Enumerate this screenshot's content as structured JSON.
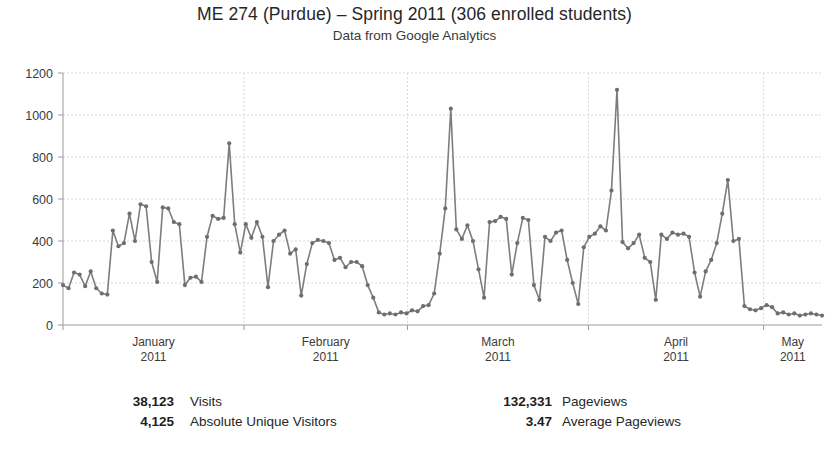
{
  "header": {
    "title": "ME 274 (Purdue) – Spring 2011 (306 enrolled students)",
    "subtitle": "Data from Google Analytics"
  },
  "axis": {
    "y_ticks": [
      "0",
      "200",
      "400",
      "600",
      "800",
      "1000",
      "1200"
    ],
    "x_labels": [
      {
        "month": "January",
        "year": "2011"
      },
      {
        "month": "February",
        "year": "2011"
      },
      {
        "month": "March",
        "year": "2011"
      },
      {
        "month": "April",
        "year": "2011"
      },
      {
        "month": "May",
        "year": "2011"
      }
    ]
  },
  "stats": {
    "left": [
      {
        "value": "38,123",
        "label": "Visits"
      },
      {
        "value": "4,125",
        "label": "Absolute Unique Visitors"
      }
    ],
    "right": [
      {
        "value": "132,331",
        "label": "Pageviews"
      },
      {
        "value": "3.47",
        "label": "Average Pageviews"
      }
    ]
  },
  "colors": {
    "line": "#7d7d7d",
    "marker": "#6e6e6e",
    "grid": "#d9d9d9",
    "axis": "#9a9a9a",
    "text": "#2b2b2b"
  },
  "chart_data": {
    "type": "line",
    "title": "ME 274 (Purdue) – Spring 2011 (306 enrolled students)",
    "subtitle": "Data from Google Analytics",
    "xlabel": "",
    "ylabel": "",
    "ylim": [
      0,
      1200
    ],
    "ytick_step": 200,
    "grid": true,
    "legend": "none",
    "marker": "circle",
    "xlim_days": [
      0,
      130
    ],
    "month_starts": [
      0,
      31,
      59,
      90,
      120
    ],
    "month_labels": [
      "January 2011",
      "February 2011",
      "March 2011",
      "April 2011",
      "May 2011"
    ],
    "series": [
      {
        "name": "Visits",
        "values": [
          190,
          175,
          250,
          240,
          185,
          255,
          175,
          150,
          145,
          450,
          375,
          390,
          530,
          400,
          575,
          565,
          300,
          205,
          560,
          555,
          490,
          480,
          190,
          225,
          230,
          205,
          420,
          520,
          505,
          510,
          865,
          480,
          345,
          480,
          415,
          490,
          420,
          180,
          400,
          430,
          450,
          340,
          360,
          140,
          290,
          390,
          405,
          400,
          390,
          310,
          320,
          275,
          300,
          300,
          280,
          190,
          130,
          60,
          50,
          55,
          50,
          60,
          55,
          70,
          65,
          90,
          95,
          150,
          340,
          555,
          1030,
          455,
          410,
          475,
          400,
          265,
          130,
          490,
          495,
          515,
          505,
          240,
          390,
          510,
          500,
          190,
          120,
          420,
          400,
          440,
          450,
          310,
          200,
          100,
          370,
          420,
          435,
          470,
          450,
          640,
          1120,
          395,
          365,
          390,
          430,
          320,
          300,
          120,
          430,
          410,
          440,
          430,
          435,
          420,
          250,
          135,
          255,
          310,
          390,
          530,
          690,
          400,
          410,
          90,
          75,
          70,
          80,
          95,
          85,
          55,
          60,
          50,
          55,
          45,
          50,
          55,
          50,
          45
        ]
      }
    ]
  }
}
